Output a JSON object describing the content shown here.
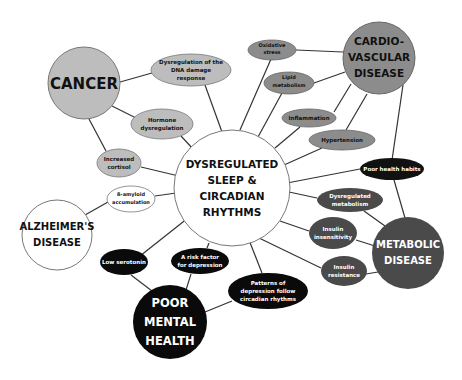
{
  "diagram": {
    "center": {
      "lines": [
        "DYSREGULATED",
        "SLEEP &",
        "CIRCADIAN",
        "RHYTHMS"
      ]
    },
    "diseases": {
      "cancer": {
        "lines": [
          "CANCER"
        ],
        "fill": "#bdbdbd"
      },
      "cardio": {
        "lines": [
          "CARDIO-",
          "VASCULAR",
          "DISEASE"
        ],
        "fill": "#8c8c8c"
      },
      "alzheimers": {
        "lines": [
          "ALZHEIMER'S",
          "DISEASE"
        ],
        "fill": "#ffffff"
      },
      "mental": {
        "lines": [
          "POOR",
          "MENTAL",
          "HEALTH"
        ],
        "fill": "#0a0a0a"
      },
      "metabolic": {
        "lines": [
          "METABOLIC",
          "DISEASE"
        ],
        "fill": "#4a4a4a"
      }
    },
    "mechanisms": {
      "dna": {
        "lines": [
          "Dysregulation of the",
          "DNA damage",
          "response"
        ]
      },
      "hormone": {
        "lines": [
          "Hormone",
          "dysregulation"
        ]
      },
      "cortisol": {
        "lines": [
          "Increased",
          "cortisol"
        ]
      },
      "oxidative": {
        "lines": [
          "Oxidative",
          "stress"
        ]
      },
      "lipid": {
        "lines": [
          "Lipid",
          "metabolism"
        ]
      },
      "inflammation": {
        "lines": [
          "Inflammation"
        ]
      },
      "hypertension": {
        "lines": [
          "Hypertension"
        ]
      },
      "habits": {
        "lines": [
          "Poor health habits"
        ]
      },
      "dysmetab": {
        "lines": [
          "Dysregulated",
          "metabolism"
        ]
      },
      "insensitivity": {
        "lines": [
          "Insulin",
          "insensitivity"
        ]
      },
      "resistance": {
        "lines": [
          "Insulin",
          "resistance"
        ]
      },
      "amyloid": {
        "lines": [
          "ß-amyloid",
          "accumulation"
        ]
      },
      "serotonin": {
        "lines": [
          "Low serotonin"
        ]
      },
      "risk": {
        "lines": [
          "A risk factor",
          "for depression"
        ]
      },
      "patterns": {
        "lines": [
          "Patterns of",
          "depression follow",
          "circadian rhythms"
        ]
      }
    },
    "colors": {
      "cancer_group": "#bdbdbd",
      "cardio_group": "#8c8c8c",
      "metabolic_group": "#4a4a4a",
      "mental_group": "#0a0a0a",
      "alzheimers_group": "#ffffff",
      "line": "#333333"
    }
  }
}
